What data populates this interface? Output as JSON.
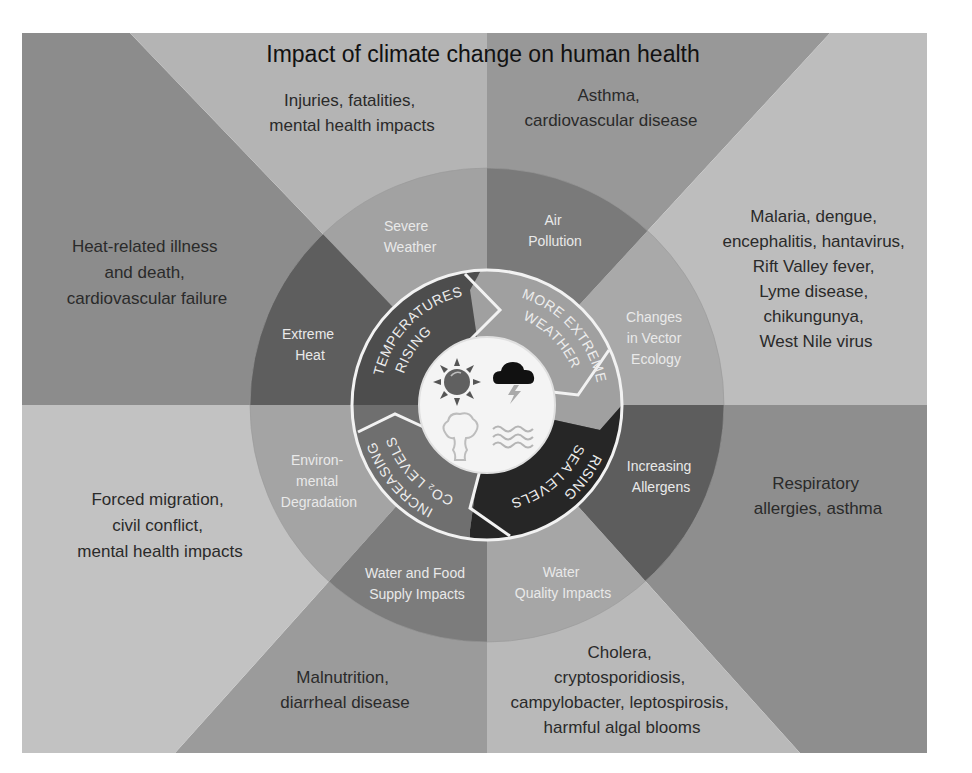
{
  "title": "Impact of climate change on human health",
  "colors": {
    "page_background": "#ffffff",
    "wedge_heat": "#8c8c8c",
    "wedge_injuries": "#b4b4b4",
    "wedge_asthma": "#989898",
    "wedge_vector": "#bdbdbd",
    "wedge_respiratory": "#8e8e8e",
    "wedge_cholera": "#b9b9b9",
    "wedge_malnutrition": "#9b9b9b",
    "wedge_migration": "#c2c2c2",
    "ring_severe_weather": "#a2a2a2",
    "ring_air_pollution": "#7a7a7a",
    "ring_vector_ecology": "#a9a9a9",
    "ring_allergens": "#5d5d5d",
    "ring_water_quality": "#a6a6a6",
    "ring_water_food": "#7c7c7c",
    "ring_env_degradation": "#a4a4a4",
    "ring_extreme_heat": "#5e5e5e",
    "band_rising_temperatures": "#4d4d4d",
    "band_more_extreme_weather": "#a0a0a0",
    "band_rising_sea_levels": "#262626",
    "band_increasing_co2": "#6f6f6f",
    "center_disc": "#f4f4f4",
    "divider_white": "#f2f2f2"
  },
  "outer_impacts": {
    "injuries": [
      "Injuries, fatalities,",
      "mental health impacts"
    ],
    "asthma": [
      "Asthma,",
      "cardiovascular disease"
    ],
    "vector": [
      "Malaria, dengue,",
      "encephalitis, hantavirus,",
      "Rift Valley fever,",
      "Lyme disease,",
      "chikungunya,",
      "West Nile virus"
    ],
    "respiratory": [
      "Respiratory",
      "allergies, asthma"
    ],
    "cholera": [
      "Cholera,",
      "cryptosporidiosis,",
      "campylobacter, leptospirosis,",
      "harmful algal blooms"
    ],
    "malnutrition": [
      "Malnutrition,",
      "diarrheal disease"
    ],
    "migration": [
      "Forced migration,",
      "civil conflict,",
      "mental health impacts"
    ],
    "heat": [
      "Heat-related illness",
      "and death,",
      "cardiovascular failure"
    ]
  },
  "ring_pathways": {
    "severe_weather": [
      "Severe",
      "Weather"
    ],
    "air_pollution": [
      "Air",
      "Pollution"
    ],
    "vector_ecology": [
      "Changes",
      "in Vector",
      "Ecology"
    ],
    "allergens": [
      "Increasing",
      "Allergens"
    ],
    "water_quality": [
      "Water",
      "Quality Impacts"
    ],
    "water_food": [
      "Water and Food",
      "Supply Impacts"
    ],
    "env_degradation": [
      "Environ-",
      "mental",
      "Degradation"
    ],
    "extreme_heat": [
      "Extreme",
      "Heat"
    ]
  },
  "climate_drivers": {
    "rising_temperatures": [
      "RISING",
      "TEMPERATURES"
    ],
    "more_extreme_weather": [
      "MORE EXTREME",
      "WEATHER"
    ],
    "rising_sea_levels": [
      "RISING",
      "SEA LEVELS"
    ],
    "increasing_co2": [
      "INCREASING",
      "CO₂ LEVELS"
    ]
  },
  "center_icons": [
    "sun-icon",
    "storm-cloud-icon",
    "smoke-plume-icon",
    "water-waves-icon"
  ]
}
